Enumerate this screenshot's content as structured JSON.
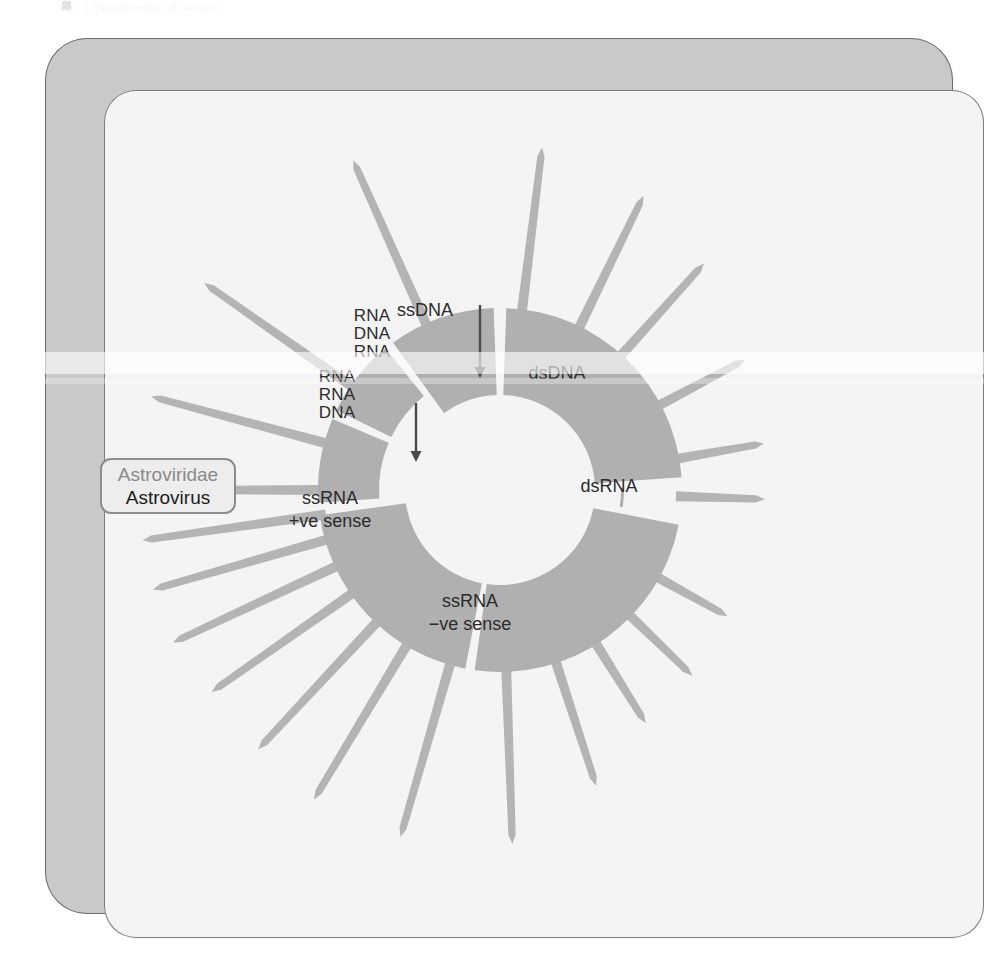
{
  "page": {
    "ghost_header_text": "Fig. 1  Classification of viruses"
  },
  "figure": {
    "title": "",
    "center": {
      "x": 500,
      "y": 490
    },
    "inner_radius": 95,
    "outer_radius": 182,
    "colors": {
      "sector_gray": "#b0b0b0",
      "spoke_gray": "#b4b4b4",
      "label_gray": "#8a8a8a",
      "inner_label_dark": "#2b2b2b",
      "frame_gray": "#c9c9c9",
      "panel_bg": "#f4f4f4",
      "highlight_border": "#8d8d8d",
      "highlight_bg": "#ededed",
      "highlight_genus": "#1c1c1c"
    },
    "genome_groups": [
      {
        "id": "ssdna",
        "label": "ssDNA",
        "label_x": 425,
        "label_y": 310,
        "has_arrow": true
      },
      {
        "id": "dsdna",
        "label": "dsDNA",
        "label_x": 557,
        "label_y": 373,
        "has_arrow": false
      },
      {
        "id": "dsrna",
        "label": "dsRNA",
        "label_x": 609,
        "label_y": 486,
        "has_arrow": false
      },
      {
        "id": "ssrna-neg",
        "label": "ssRNA\n−ve sense",
        "line1": "ssRNA",
        "line2": "−ve sense",
        "label_x": 470,
        "label_y": 612,
        "has_arrow": false
      },
      {
        "id": "ssrna-pos",
        "label": "ssRNA\n+ve sense",
        "line1": "ssRNA",
        "line2": "+ve sense",
        "label_x": 330,
        "label_y": 509,
        "has_arrow": false
      },
      {
        "id": "rna-rna-dna",
        "label": "RNA\nRNA\nDNA",
        "line1": "RNA",
        "line2": "RNA",
        "line3": "DNA",
        "label_x": 337,
        "label_y": 395,
        "has_arrow": true
      },
      {
        "id": "rna-dna-rna",
        "label": "RNA\nDNA\nRNA",
        "line1": "RNA",
        "line2": "DNA",
        "line3": "RNA",
        "label_x": 372,
        "label_y": 334,
        "has_arrow": false
      }
    ],
    "families": [
      {
        "name": "Adenoviridae",
        "label_x": 472,
        "label_y": 141,
        "angle_deg": -83,
        "anchor": "start",
        "group": "dsdna",
        "highlighted": false,
        "faded": false
      },
      {
        "name": "Poxviridae",
        "label_x": 612,
        "label_y": 177,
        "angle_deg": -64,
        "anchor": "start",
        "group": "dsdna",
        "highlighted": false,
        "faded": false
      },
      {
        "name": "Herpesviridae",
        "label_x": 676,
        "label_y": 235,
        "angle_deg": -48,
        "anchor": "start",
        "group": "dsdna",
        "highlighted": false,
        "faded": false
      },
      {
        "name": "Papillomaviridae",
        "label_x": 724,
        "label_y": 318,
        "angle_deg": -28,
        "anchor": "start",
        "group": "dsdna",
        "highlighted": false,
        "faded": false
      },
      {
        "name": "Polyomaviridae",
        "label_x": 766,
        "label_y": 428,
        "angle_deg": -10,
        "anchor": "start",
        "group": "dsdna",
        "highlighted": false,
        "faded": false
      },
      {
        "name": "Reoviridae",
        "label_x": 770,
        "label_y": 493,
        "angle_deg": 2,
        "anchor": "start",
        "group": "dsrna",
        "highlighted": false,
        "faded": false
      },
      {
        "name": "Rhabdoviridae",
        "label_x": 724,
        "label_y": 632,
        "angle_deg": 29,
        "anchor": "start",
        "group": "ssrna-neg",
        "highlighted": false,
        "faded": false
      },
      {
        "name": "Filoviridae",
        "label_x": 677,
        "label_y": 697,
        "angle_deg": 44,
        "anchor": "start",
        "group": "ssrna-neg",
        "highlighted": false,
        "faded": false
      },
      {
        "name": "Paramyxoviridae",
        "label_x": 599,
        "label_y": 752,
        "angle_deg": 58,
        "anchor": "start",
        "group": "ssrna-neg",
        "highlighted": false,
        "faded": false
      },
      {
        "name": "Bunyaviridae",
        "label_x": 561,
        "label_y": 800,
        "angle_deg": 72,
        "anchor": "start",
        "group": "ssrna-neg",
        "highlighted": false,
        "faded": false
      },
      {
        "name": "Arenaviridae",
        "label_x": 433,
        "label_y": 843,
        "angle_deg": 88,
        "anchor": "start",
        "group": "ssrna-neg",
        "highlighted": false,
        "faded": false
      },
      {
        "name": "Orthomyxoviridae",
        "label_x": 279,
        "label_y": 794,
        "angle_deg": 106,
        "anchor": "end",
        "group": "ssrna-neg",
        "highlighted": false,
        "faded": false
      },
      {
        "name": "Coronaviridae",
        "label_x": 216,
        "label_y": 739,
        "angle_deg": 121,
        "anchor": "end",
        "group": "ssrna-pos",
        "highlighted": false,
        "faded": false
      },
      {
        "name": "Flaviviridae",
        "label_x": 196,
        "label_y": 682,
        "angle_deg": 133,
        "anchor": "end",
        "group": "ssrna-pos",
        "highlighted": false,
        "faded": false
      },
      {
        "name": "Togaviridae",
        "label_x": 163,
        "label_y": 608,
        "angle_deg": 145,
        "anchor": "end",
        "group": "ssrna-pos",
        "highlighted": false,
        "faded": false
      },
      {
        "name": "Hepeviridae",
        "label_x": 134,
        "label_y": 566,
        "angle_deg": 155,
        "anchor": "end",
        "group": "ssrna-pos",
        "highlighted": false,
        "faded": false
      },
      {
        "name": "Caliciviridae",
        "label_x": 128,
        "label_y": 541,
        "angle_deg": 164,
        "anchor": "end",
        "group": "ssrna-pos",
        "highlighted": false,
        "faded": false
      },
      {
        "name": "Astroviridae",
        "label_x": 108,
        "label_y": 478,
        "angle_deg": 172,
        "anchor": "end",
        "group": "ssrna-pos",
        "highlighted": true,
        "faded": false
      },
      {
        "name": "Picornaviridae",
        "label_x": 112,
        "label_y": 434,
        "angle_deg": 180,
        "anchor": "end",
        "group": "ssrna-pos",
        "highlighted": false,
        "faded": false
      },
      {
        "name": "Hepadnaviridae",
        "label_x": 110,
        "label_y": 365,
        "angle_deg": 195,
        "anchor": "end",
        "group": "rna-rna-dna",
        "highlighted": false,
        "faded": true
      },
      {
        "name": "Retroviridae",
        "label_x": 197,
        "label_y": 242,
        "angle_deg": 215,
        "anchor": "end",
        "group": "rna-dna-rna",
        "highlighted": false,
        "faded": false
      },
      {
        "name": "Parvoviridae",
        "label_x": 294,
        "label_y": 178,
        "angle_deg": 246,
        "anchor": "end",
        "group": "ssdna",
        "highlighted": false,
        "faded": false
      }
    ],
    "highlight": {
      "family": "Astroviridae",
      "genus": "Astrovirus"
    }
  }
}
